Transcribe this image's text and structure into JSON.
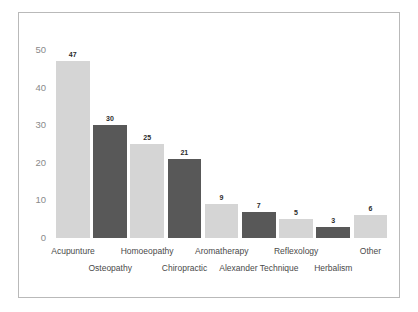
{
  "caption": {
    "text": "....... ..... ....... ......."
  },
  "chart_data": {
    "type": "bar",
    "title": "",
    "xlabel": "",
    "ylabel": "",
    "ylim": [
      0,
      50
    ],
    "yticks": [
      "0",
      "10",
      "20",
      "30",
      "40",
      "50"
    ],
    "grid": false,
    "legend": "none",
    "categories": [
      "Acupunture",
      "Osteopathy",
      "Homoeopathy",
      "Chiropractic",
      "Aromatherapy",
      "Alexander Technique",
      "Reflexology",
      "Herbalism",
      "Other"
    ],
    "values": [
      47,
      30,
      25,
      21,
      9,
      7,
      5,
      3,
      6
    ],
    "value_labels": [
      "47",
      "30",
      "25",
      "21",
      "9",
      "7",
      "5",
      "3",
      "6"
    ],
    "bar_colors": [
      "#d5d5d5",
      "#585858",
      "#d5d5d5",
      "#585858",
      "#d5d5d5",
      "#585858",
      "#d5d5d5",
      "#585858",
      "#d5d5d5"
    ],
    "label_rows": [
      0,
      1,
      0,
      1,
      0,
      1,
      0,
      1,
      0
    ]
  },
  "colors": {
    "light_bar": "#d5d5d5",
    "dark_bar": "#585858",
    "frame": "#b9b9b9",
    "tick_text": "#8a8a8a",
    "category_text": "#4a4a4a",
    "value_text": "#2b2b2b"
  }
}
